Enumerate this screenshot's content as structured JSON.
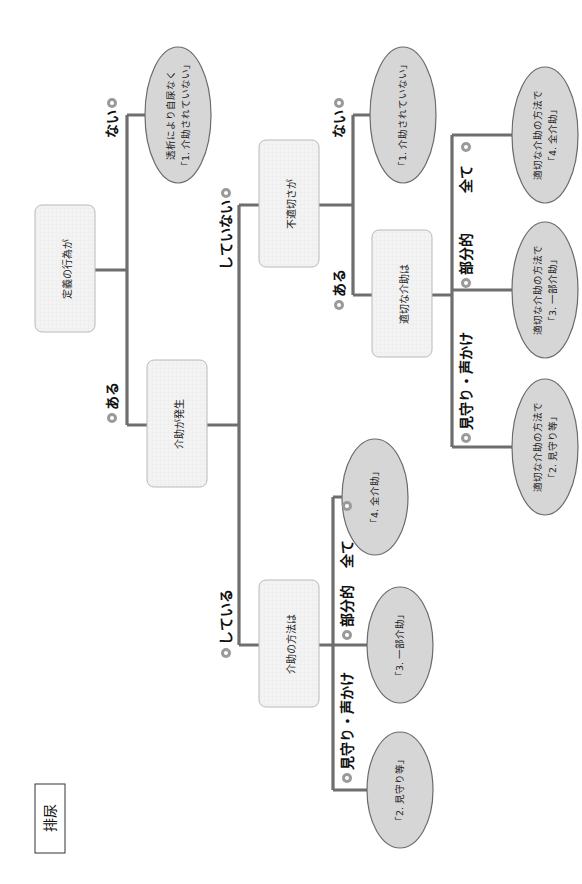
{
  "title": "排尿",
  "orientation": "rotated-90-ccw",
  "colors": {
    "connector": "#6e6e6e",
    "box_fill": "#f1f1f1",
    "box_border": "#b9b9b9",
    "ellipse_fill": "#d6d6d6",
    "ellipse_border": "#6b6b6b",
    "pin_icon": "#9a9a9a"
  },
  "nodes": {
    "q1": "定義の行為が",
    "q2": "介助が発生",
    "q3": "不適切さが",
    "q4": "介助の方法は",
    "q5": "適切な介助は"
  },
  "results": {
    "r_dialysis": [
      "透析により自尿なく",
      "「1. 介助されていない」"
    ],
    "r_none": [
      "「1. 介助されていない」"
    ],
    "r_app_full": [
      "適切な介助の方法で",
      "「4. 全介助」"
    ],
    "r_app_partial": [
      "適切な介助の方法で",
      "「3. 一部介助」"
    ],
    "r_app_watch": [
      "適切な介助の方法で",
      "「2. 見守り等」"
    ],
    "r_full": [
      "「4. 全介助」"
    ],
    "r_partial": [
      "「3. 一部介助」"
    ],
    "r_watch": [
      "「2. 見守り等」"
    ]
  },
  "labels": {
    "q1_yes": "ある",
    "q1_no": "ない",
    "q2_yes": "している",
    "q2_no": "していない",
    "q3_yes": "ある",
    "q3_no": "ない",
    "q5_watch": "見守り・声かけ",
    "q5_partial": "部分的",
    "q5_full": "全て",
    "q4_watch": "見守り・声かけ",
    "q4_partial": "部分的",
    "q4_full": "全て"
  }
}
